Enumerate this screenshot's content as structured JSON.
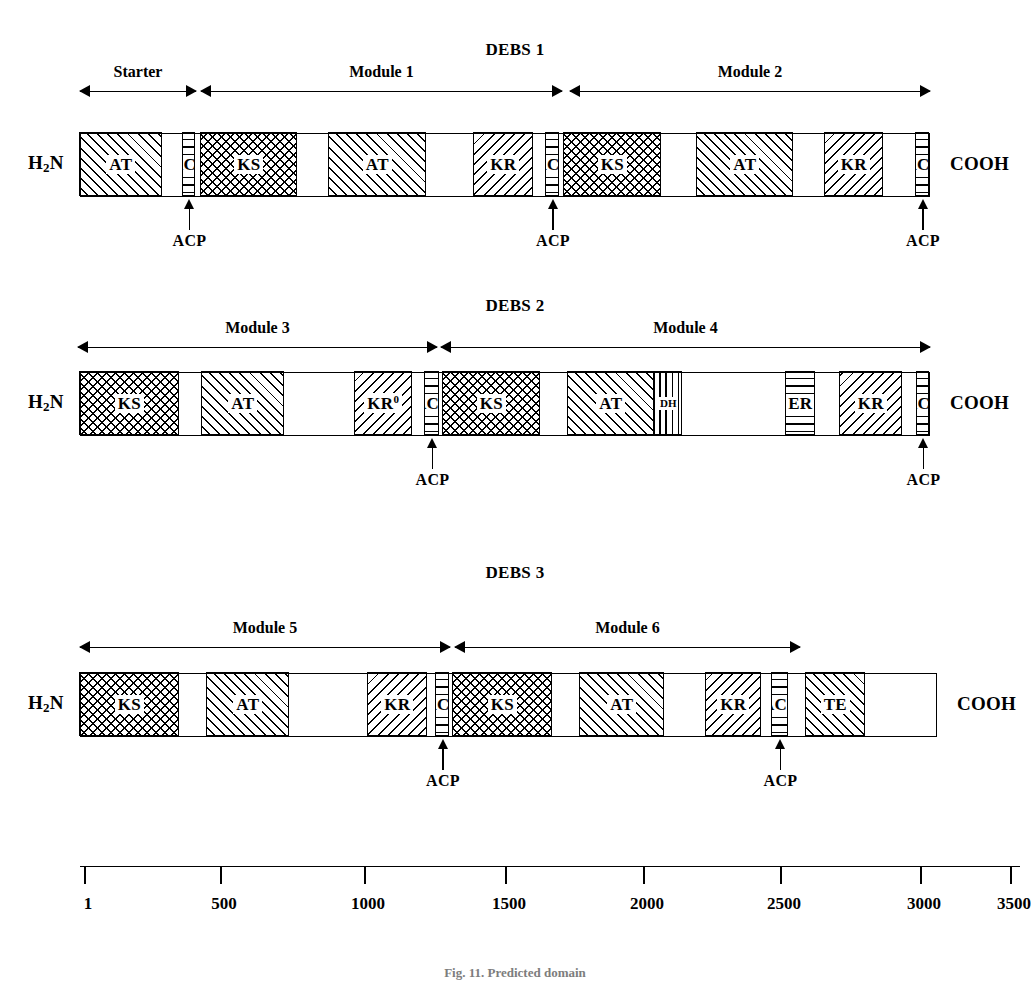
{
  "figure": {
    "caption": "Fig. 11. Predicted domain",
    "scale_unit": "amino acid residues"
  },
  "termini": {
    "n_terminus": "H2N",
    "n_terminus_prefix": "H",
    "n_terminus_sub": "2",
    "n_terminus_suffix": "N",
    "c_terminus": "COOH"
  },
  "acp_label": "ACP",
  "proteins": [
    {
      "title": "DEBS 1",
      "modules": [
        {
          "label": "Starter",
          "start_px": 80,
          "end_px": 196
        },
        {
          "label": "Module 1",
          "start_px": 201,
          "end_px": 562
        },
        {
          "label": "Module 2",
          "start_px": 570,
          "end_px": 930
        }
      ],
      "backbone": {
        "start_px": 80,
        "end_px": 930
      },
      "domains": [
        {
          "label": "AT",
          "pattern": "fwd-diagonal",
          "start_px": 80,
          "end_px": 163
        },
        {
          "label": "ACP",
          "pattern": "horizontal-lines",
          "start_px": 183,
          "end_px": 196,
          "callout": true
        },
        {
          "label": "KS",
          "pattern": "cross-hatch",
          "start_px": 201,
          "end_px": 298
        },
        {
          "label": "AT",
          "pattern": "fwd-diagonal",
          "start_px": 329,
          "end_px": 427
        },
        {
          "label": "KR",
          "pattern": "back-diagonal",
          "start_px": 474,
          "end_px": 534
        },
        {
          "label": "ACP",
          "pattern": "horizontal-lines",
          "start_px": 546,
          "end_px": 560,
          "callout": true
        },
        {
          "label": "KS",
          "pattern": "cross-hatch",
          "start_px": 564,
          "end_px": 662
        },
        {
          "label": "AT",
          "pattern": "fwd-diagonal",
          "start_px": 697,
          "end_px": 794
        },
        {
          "label": "KR",
          "pattern": "back-diagonal",
          "start_px": 825,
          "end_px": 884
        },
        {
          "label": "ACP",
          "pattern": "horizontal-lines",
          "start_px": 916,
          "end_px": 930,
          "callout": true
        }
      ]
    },
    {
      "title": "DEBS 2",
      "modules": [
        {
          "label": "Module 3",
          "start_px": 78,
          "end_px": 437
        },
        {
          "label": "Module 4",
          "start_px": 441,
          "end_px": 930
        }
      ],
      "backbone": {
        "start_px": 80,
        "end_px": 930
      },
      "domains": [
        {
          "label": "KS",
          "pattern": "cross-hatch",
          "start_px": 80,
          "end_px": 180
        },
        {
          "label": "AT",
          "pattern": "fwd-diagonal",
          "start_px": 202,
          "end_px": 285
        },
        {
          "label": "KR0",
          "pattern": "back-diagonal",
          "start_px": 355,
          "end_px": 413,
          "superscript": "0"
        },
        {
          "label": "ACP",
          "pattern": "horizontal-lines",
          "start_px": 425,
          "end_px": 440,
          "callout": true
        },
        {
          "label": "KS",
          "pattern": "cross-hatch",
          "start_px": 443,
          "end_px": 541
        },
        {
          "label": "AT",
          "pattern": "fwd-diagonal",
          "start_px": 568,
          "end_px": 655
        },
        {
          "label": "DH",
          "pattern": "vertical-lines",
          "start_px": 655,
          "end_px": 683,
          "small": true
        },
        {
          "label": "ER",
          "pattern": "horizontal-lines",
          "start_px": 786,
          "end_px": 816
        },
        {
          "label": "KR",
          "pattern": "back-diagonal",
          "start_px": 840,
          "end_px": 903
        },
        {
          "label": "ACP",
          "pattern": "horizontal-lines",
          "start_px": 917,
          "end_px": 930,
          "callout": true
        }
      ]
    },
    {
      "title": "DEBS 3",
      "modules": [
        {
          "label": "Module 5",
          "start_px": 80,
          "end_px": 450
        },
        {
          "label": "Module 6",
          "start_px": 455,
          "end_px": 800
        }
      ],
      "backbone": {
        "start_px": 80,
        "end_px": 937
      },
      "domains": [
        {
          "label": "KS",
          "pattern": "cross-hatch",
          "start_px": 80,
          "end_px": 180
        },
        {
          "label": "AT",
          "pattern": "fwd-diagonal",
          "start_px": 207,
          "end_px": 290
        },
        {
          "label": "KR",
          "pattern": "back-diagonal",
          "start_px": 368,
          "end_px": 428
        },
        {
          "label": "ACP",
          "pattern": "horizontal-lines",
          "start_px": 436,
          "end_px": 450,
          "callout": true
        },
        {
          "label": "KS",
          "pattern": "cross-hatch",
          "start_px": 453,
          "end_px": 553
        },
        {
          "label": "AT",
          "pattern": "fwd-diagonal",
          "start_px": 580,
          "end_px": 665
        },
        {
          "label": "KR",
          "pattern": "back-diagonal",
          "start_px": 706,
          "end_px": 762
        },
        {
          "label": "ACP",
          "pattern": "horizontal-lines",
          "start_px": 772,
          "end_px": 789,
          "callout": true
        },
        {
          "label": "TE",
          "pattern": "fwd-diagonal",
          "start_px": 806,
          "end_px": 866
        }
      ]
    }
  ],
  "chart_data": {
    "type": "table",
    "xlabel": "amino acid residues",
    "scale": {
      "ticks": [
        1,
        500,
        1000,
        1500,
        2000,
        2500,
        3000,
        3500
      ],
      "tick_px": [
        84,
        220,
        364,
        505,
        643,
        780,
        920,
        1010
      ],
      "axis_start_px": 80,
      "axis_end_px": 1020
    },
    "legend": [
      {
        "domain": "KS",
        "name": "ketosynthase",
        "pattern": "cross-hatch"
      },
      {
        "domain": "AT",
        "name": "acyltransferase",
        "pattern": "forward-diagonal"
      },
      {
        "domain": "KR",
        "name": "ketoreductase",
        "pattern": "back-diagonal"
      },
      {
        "domain": "KR0",
        "name": "inactive ketoreductase",
        "pattern": "back-diagonal"
      },
      {
        "domain": "DH",
        "name": "dehydratase",
        "pattern": "vertical-lines"
      },
      {
        "domain": "ER",
        "name": "enoylreductase",
        "pattern": "horizontal-lines"
      },
      {
        "domain": "ACP",
        "name": "acyl carrier protein",
        "pattern": "horizontal-lines"
      },
      {
        "domain": "TE",
        "name": "thioesterase",
        "pattern": "forward-diagonal"
      }
    ],
    "proteins": [
      {
        "name": "DEBS 1",
        "modules": [
          "Starter",
          "Module 1",
          "Module 2"
        ],
        "domain_order": [
          "AT",
          "ACP",
          "KS",
          "AT",
          "KR",
          "ACP",
          "KS",
          "AT",
          "KR",
          "ACP"
        ]
      },
      {
        "name": "DEBS 2",
        "modules": [
          "Module 3",
          "Module 4"
        ],
        "domain_order": [
          "KS",
          "AT",
          "KR0",
          "ACP",
          "KS",
          "AT",
          "DH",
          "ER",
          "KR",
          "ACP"
        ]
      },
      {
        "name": "DEBS 3",
        "modules": [
          "Module 5",
          "Module 6"
        ],
        "domain_order": [
          "KS",
          "AT",
          "KR",
          "ACP",
          "KS",
          "AT",
          "KR",
          "ACP",
          "TE"
        ]
      }
    ]
  }
}
